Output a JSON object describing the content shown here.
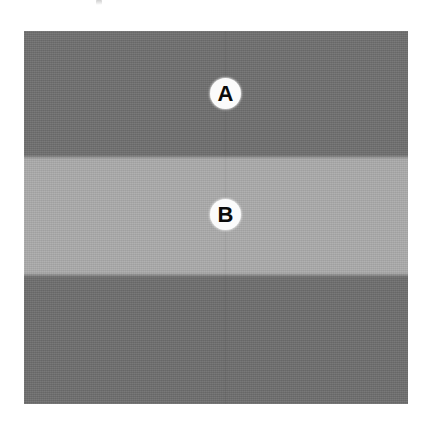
{
  "figure": {
    "type": "grayscale-band-illustration",
    "plate": {
      "x": 24,
      "y": 31,
      "width": 384,
      "height": 373
    },
    "background_color": "#ffffff"
  },
  "bands": [
    {
      "id": "band-dark-top",
      "label": "upper dark band",
      "color": "#6f6f6f",
      "top": 0,
      "height": 126
    },
    {
      "id": "band-light",
      "label": "middle light band",
      "color": "#ababab",
      "top": 126,
      "height": 118
    },
    {
      "id": "band-dark-bottom",
      "label": "lower dark band",
      "color": "#6e6e6e",
      "top": 244,
      "height": 129
    }
  ],
  "markers": [
    {
      "id": "marker-a",
      "letter": "A",
      "on_band": "band-dark-top",
      "center_x": 201,
      "center_y": 62,
      "circle_color": "#fbfbfb",
      "text_color": "#0b0b0b"
    },
    {
      "id": "marker-b",
      "letter": "B",
      "on_band": "band-light",
      "center_x": 201,
      "center_y": 183,
      "circle_color": "#fbfbfb",
      "text_color": "#0b0b0b"
    }
  ],
  "artifacts": {
    "top_mark": {
      "label": "faint scan artifact",
      "x": 96,
      "y": 0,
      "width": 6,
      "height": 5
    },
    "vertical_seam": {
      "label": "faint vertical seam",
      "x": 200
    }
  }
}
